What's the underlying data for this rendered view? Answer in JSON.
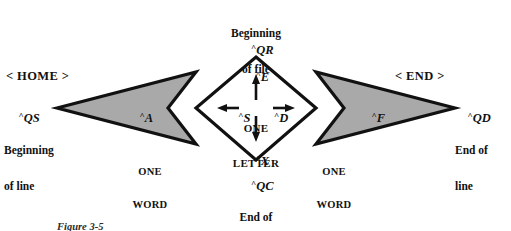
{
  "figure": {
    "title_caption": "Figure 3-5",
    "type": "cursor-movement-diagram",
    "colors": {
      "wing_fill": "#a9a9a9",
      "stroke": "#111111",
      "inner_fill": "#ffffff",
      "background": "#ffffff",
      "text": "#111111"
    }
  },
  "labels": {
    "top": {
      "description_line1": "Beginning",
      "description_line2": "of file",
      "command": "QR",
      "caret": "^",
      "inner_command": "E",
      "arrow": "up-arrow"
    },
    "bottom": {
      "inner_command": "X",
      "caret": "^",
      "command": "QC",
      "description_line1": "End of",
      "description_line2": "file",
      "arrow": "down-arrow"
    },
    "left": {
      "key_label": "< HOME >",
      "command": "QS",
      "caret": "^",
      "description_line1": "Beginning",
      "description_line2": "of line",
      "word_command": "A",
      "inner_command": "S",
      "unit_line1": "ONE",
      "unit_line2": "WORD",
      "arrow": "left-arrow"
    },
    "right": {
      "key_label": "< END >",
      "command": "QD",
      "caret": "^",
      "description_line1": "End of",
      "description_line2": "line",
      "word_command": "F",
      "inner_command": "D",
      "unit_line1": "ONE",
      "unit_line2": "WORD",
      "arrow": "right-arrow"
    },
    "center": {
      "unit_line1": "ONE",
      "unit_line2": "LETTER"
    }
  }
}
